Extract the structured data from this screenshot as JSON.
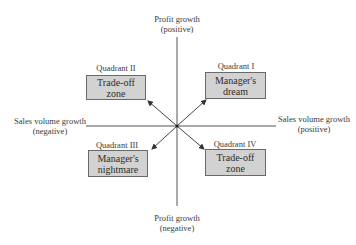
{
  "axes": {
    "top": {
      "line1": "Profit growth",
      "line2": "(positive)"
    },
    "bottom": {
      "line1": "Profit growth",
      "line2": "(negative)"
    },
    "left": {
      "line1": "Sales volume growth",
      "line2": "(negative)"
    },
    "right": {
      "line1": "Sales volume growth",
      "line2": "(positive)"
    }
  },
  "quadrants": [
    {
      "id": "I",
      "label": "Quadrant I",
      "line1": "Manager's",
      "line2": "dream"
    },
    {
      "id": "II",
      "label": "Quadrant II",
      "line1": "Trade-off",
      "line2": "zone"
    },
    {
      "id": "III",
      "label": "Quadrant III",
      "line1": "Manager's",
      "line2": "nightmare"
    },
    {
      "id": "IV",
      "label": "Quadrant IV",
      "line1": "Trade-off",
      "line2": "zone"
    }
  ],
  "colors": {
    "box_fill": "#d2d2d2",
    "line": "#444444"
  }
}
